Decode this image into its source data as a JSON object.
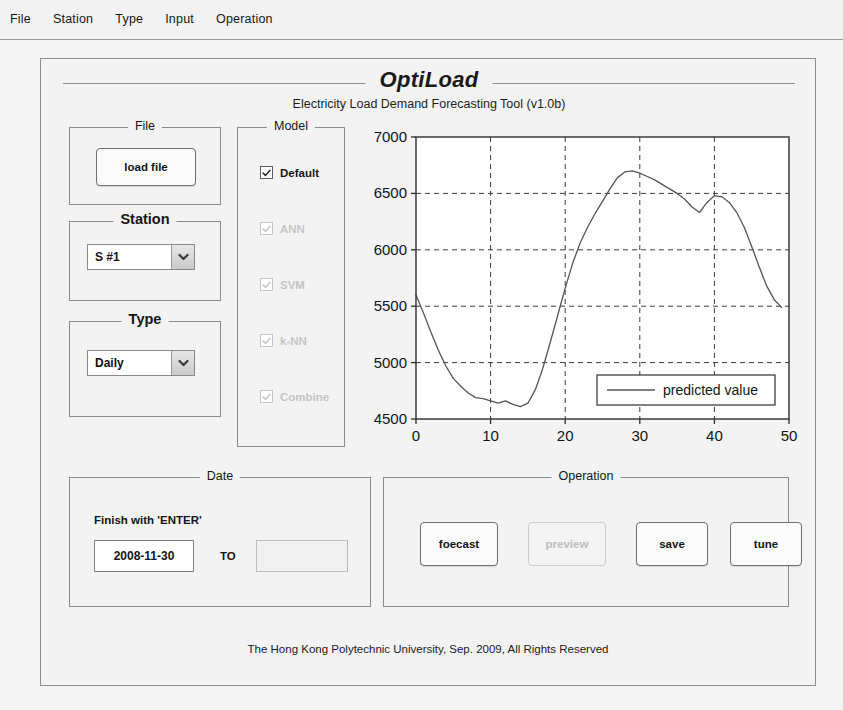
{
  "menubar": {
    "items": [
      {
        "label": "File"
      },
      {
        "label": "Station"
      },
      {
        "label": "Type"
      },
      {
        "label": "Input"
      },
      {
        "label": "Operation"
      }
    ]
  },
  "header": {
    "title": "OptiLoad",
    "subtitle": "Electricity Load Demand Forecasting Tool  (v1.0b)"
  },
  "panels": {
    "file": {
      "title": "File",
      "load_button": "load file"
    },
    "station": {
      "title": "Station",
      "selected": "S #1",
      "arrow_icon": "chevron-down-icon"
    },
    "type": {
      "title": "Type",
      "selected": "Daily",
      "arrow_icon": "chevron-down-icon"
    },
    "model": {
      "title": "Model",
      "options": [
        {
          "label": "Default",
          "checked": true,
          "disabled": false
        },
        {
          "label": "ANN",
          "checked": true,
          "disabled": true
        },
        {
          "label": "SVM",
          "checked": true,
          "disabled": true
        },
        {
          "label": "k-NN",
          "checked": true,
          "disabled": true
        },
        {
          "label": "Combine",
          "checked": true,
          "disabled": true
        }
      ]
    },
    "date": {
      "title": "Date",
      "hint": "Finish with 'ENTER'",
      "start_value": "2008-11-30",
      "separator": "TO",
      "end_value": "",
      "end_disabled": true
    },
    "operation": {
      "title": "Operation",
      "buttons": [
        {
          "label": "foecast",
          "disabled": false
        },
        {
          "label": "preview",
          "disabled": true
        },
        {
          "label": "save",
          "disabled": false
        },
        {
          "label": "tune",
          "disabled": false
        }
      ]
    }
  },
  "footer": {
    "text": "The Hong Kong Polytechnic University, Sep. 2009, All Rights Reserved"
  },
  "chart_data": {
    "type": "line",
    "title": "",
    "xlabel": "",
    "ylabel": "",
    "xlim": [
      0,
      50
    ],
    "ylim": [
      4500,
      7000
    ],
    "xticks": [
      0,
      10,
      20,
      30,
      40,
      50
    ],
    "yticks": [
      4500,
      5000,
      5500,
      6000,
      6500,
      7000
    ],
    "grid": true,
    "grid_style": "dashed",
    "legend": {
      "position": "bottom-right",
      "entries": [
        "predicted value"
      ]
    },
    "series": [
      {
        "name": "predicted value",
        "color": "#555555",
        "x": [
          0,
          1,
          2,
          3,
          4,
          5,
          6,
          7,
          8,
          9,
          10,
          11,
          12,
          13,
          14,
          15,
          16,
          17,
          18,
          19,
          20,
          21,
          22,
          23,
          24,
          25,
          26,
          27,
          28,
          29,
          30,
          31,
          32,
          33,
          34,
          35,
          36,
          37,
          38,
          39,
          40,
          41,
          42,
          43,
          44,
          45,
          46,
          47,
          48,
          49
        ],
        "y": [
          5600,
          5440,
          5270,
          5110,
          4970,
          4860,
          4790,
          4730,
          4690,
          4680,
          4660,
          4640,
          4660,
          4630,
          4610,
          4640,
          4760,
          4950,
          5180,
          5420,
          5660,
          5880,
          6060,
          6200,
          6320,
          6430,
          6540,
          6640,
          6690,
          6700,
          6680,
          6650,
          6620,
          6580,
          6540,
          6500,
          6450,
          6380,
          6330,
          6420,
          6480,
          6470,
          6420,
          6330,
          6200,
          6030,
          5850,
          5680,
          5560,
          5490
        ]
      }
    ]
  }
}
